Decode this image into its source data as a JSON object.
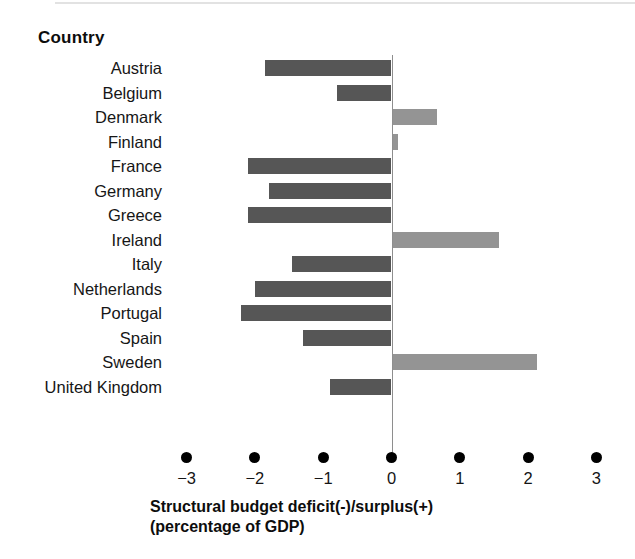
{
  "header": {
    "country_label": "Country"
  },
  "axis": {
    "title_line1": "Structural budget deficit(-)/surplus(+)",
    "title_line2": "(percentage of GDP)",
    "ticks": [
      "−3",
      "−2",
      "−1",
      "0",
      "1",
      "2",
      "3"
    ]
  },
  "colors": {
    "deficit_bar": "#565656",
    "surplus_bar": "#949494",
    "zero_line": "#8e8e8e",
    "text": "#161616",
    "background": "#ffffff"
  },
  "chart_data": {
    "type": "bar",
    "orientation": "horizontal",
    "title": "",
    "xlabel": "Structural budget deficit(-)/surplus(+) (percentage of GDP)",
    "ylabel": "Country",
    "xlim": [
      -3,
      3
    ],
    "xticks": [
      -3,
      -2,
      -1,
      0,
      1,
      2,
      3
    ],
    "grid": false,
    "legend": null,
    "categories": [
      "Austria",
      "Belgium",
      "Denmark",
      "Finland",
      "France",
      "Germany",
      "Greece",
      "Ireland",
      "Italy",
      "Netherlands",
      "Portugal",
      "Spain",
      "Sweden",
      "United Kingdom"
    ],
    "values": [
      -1.85,
      -0.8,
      0.65,
      0.07,
      -2.1,
      -1.8,
      -2.1,
      1.55,
      -1.45,
      -2.0,
      -2.2,
      -1.3,
      2.1,
      -0.9
    ],
    "bars": [
      {
        "label": "Austria",
        "value": -1.85,
        "sign": "negative"
      },
      {
        "label": "Belgium",
        "value": -0.8,
        "sign": "negative"
      },
      {
        "label": "Denmark",
        "value": 0.65,
        "sign": "positive"
      },
      {
        "label": "Finland",
        "value": 0.07,
        "sign": "positive"
      },
      {
        "label": "France",
        "value": -2.1,
        "sign": "negative"
      },
      {
        "label": "Germany",
        "value": -1.8,
        "sign": "negative"
      },
      {
        "label": "Greece",
        "value": -2.1,
        "sign": "negative"
      },
      {
        "label": "Ireland",
        "value": 1.55,
        "sign": "positive"
      },
      {
        "label": "Italy",
        "value": -1.45,
        "sign": "negative"
      },
      {
        "label": "Netherlands",
        "value": -2.0,
        "sign": "negative"
      },
      {
        "label": "Portugal",
        "value": -2.2,
        "sign": "negative"
      },
      {
        "label": "Spain",
        "value": -1.3,
        "sign": "negative"
      },
      {
        "label": "Sweden",
        "value": 2.1,
        "sign": "positive"
      },
      {
        "label": "United Kingdom",
        "value": -0.9,
        "sign": "negative"
      }
    ]
  }
}
